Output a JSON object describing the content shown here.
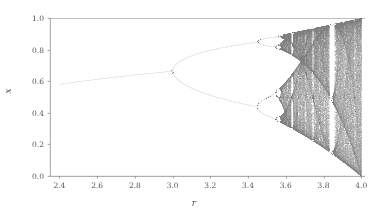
{
  "figure": {
    "width": 388,
    "height": 222,
    "background": "#ffffff",
    "axes_color": "#808080",
    "tick_color": "#555555",
    "data_color": "#303030"
  },
  "chart_data": {
    "type": "scatter",
    "title": "",
    "subtitle": "",
    "xlabel": "r",
    "ylabel": "x",
    "xlim": [
      2.35,
      4.02
    ],
    "ylim": [
      0.0,
      1.0
    ],
    "xticks": [
      2.4,
      2.6,
      2.8,
      3.0,
      3.2,
      3.4,
      3.6,
      3.8,
      4.0
    ],
    "xticklabels": [
      "2.4",
      "2.6",
      "2.8",
      "3.0",
      "3.2",
      "3.4",
      "3.6",
      "3.8",
      "4.0"
    ],
    "yticks": [
      0.0,
      0.2,
      0.4,
      0.6,
      0.8,
      1.0
    ],
    "yticklabels": [
      "0.0",
      "0.2",
      "0.4",
      "0.6",
      "0.8",
      "1.0"
    ],
    "grid": false,
    "legend": null,
    "annotations": [],
    "map": {
      "equation": "x_{n+1} = r * x_n * (1 - x_n)",
      "r_min": 2.4,
      "r_max": 4.0,
      "r_steps": 1600,
      "x0": 0.5,
      "transient_iterations": 300,
      "plot_iterations": 260
    },
    "features": [
      {
        "name": "stable-fixed-point",
        "r_range": [
          2.4,
          3.0
        ],
        "x_range": [
          0.583,
          0.667
        ]
      },
      {
        "name": "period-2",
        "r_range": [
          3.0,
          3.449
        ],
        "x_range": [
          0.44,
          0.86
        ]
      },
      {
        "name": "period-4",
        "r_range": [
          3.449,
          3.544
        ],
        "x_range": [
          0.38,
          0.88
        ]
      },
      {
        "name": "onset-of-chaos",
        "r_range": [
          3.5699,
          3.5699
        ],
        "x_range": [
          0.33,
          0.89
        ]
      },
      {
        "name": "chaotic-band",
        "r_range": [
          3.5699,
          4.0
        ],
        "x_range": [
          0.0,
          1.0
        ]
      },
      {
        "name": "period-3-window",
        "r_range": [
          3.8284,
          3.8415
        ],
        "x_range": [
          0.15,
          0.96
        ]
      }
    ]
  },
  "axis": {
    "x_label_text": "r",
    "y_label_text": "x"
  }
}
